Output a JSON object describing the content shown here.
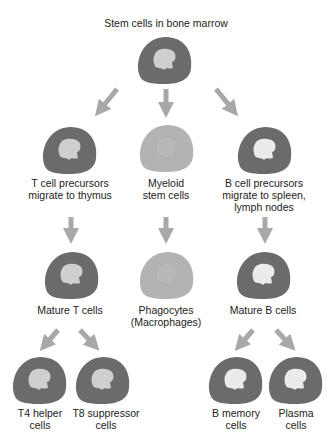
{
  "colors": {
    "cell_dark": "#6b6b6b",
    "cell_light": "#b3b3b3",
    "nucleus": "#cfcfcf",
    "nucleus_light": "#ebebeb",
    "arrow": "#a8a8a8"
  },
  "title": "Stem cells in bone marrow",
  "nodes": {
    "stem": {
      "label": "Stem cells in bone marrow"
    },
    "t_precursor": {
      "line1": "T cell precursors",
      "line2": "migrate to thymus"
    },
    "myeloid": {
      "line1": "Myeloid",
      "line2": "stem cells"
    },
    "b_precursor": {
      "line1": "B cell precursors",
      "line2": "migrate to spleen,",
      "line3": "lymph nodes"
    },
    "mature_t": {
      "line1": "Mature T cells"
    },
    "phagocytes": {
      "line1": "Phagocytes",
      "line2": "(Macrophages)"
    },
    "mature_b": {
      "line1": "Mature B cells"
    },
    "t4": {
      "line1": "T4 helper",
      "line2": "cells"
    },
    "t8": {
      "line1": "T8 suppressor",
      "line2": "cells"
    },
    "b_memory": {
      "line1": "B memory",
      "line2": "cells"
    },
    "plasma": {
      "line1": "Plasma",
      "line2": "cells"
    }
  }
}
